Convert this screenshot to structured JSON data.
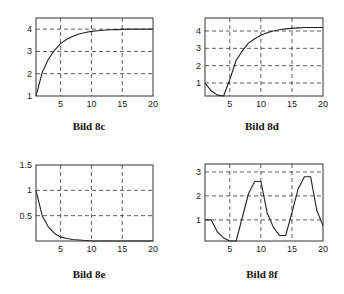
{
  "chart_data": [
    {
      "id": "8c",
      "type": "line",
      "title": "Bild 8c",
      "xlabel": "",
      "ylabel": "",
      "xlim": [
        1,
        20
      ],
      "ylim": [
        1,
        4.5
      ],
      "xticks": [
        5,
        10,
        15,
        20
      ],
      "yticks": [
        1,
        2,
        3,
        4
      ],
      "grid": true,
      "x": [
        1,
        2,
        3,
        4,
        5,
        6,
        7,
        8,
        9,
        10,
        11,
        12,
        13,
        14,
        15,
        16,
        17,
        18,
        19,
        20
      ],
      "values": [
        1.0,
        2.05,
        2.65,
        3.05,
        3.35,
        3.55,
        3.68,
        3.78,
        3.85,
        3.9,
        3.93,
        3.95,
        3.97,
        3.98,
        3.99,
        4.0,
        4.0,
        4.0,
        4.0,
        4.0
      ]
    },
    {
      "id": "8d",
      "type": "line",
      "title": "Bild 8d",
      "xlabel": "",
      "ylabel": "",
      "xlim": [
        1,
        20
      ],
      "ylim": [
        0.25,
        4.75
      ],
      "xticks": [
        5,
        10,
        15,
        20
      ],
      "yticks": [
        1,
        2,
        3,
        4
      ],
      "grid": true,
      "x": [
        1,
        2,
        3,
        4,
        5,
        6,
        7,
        8,
        9,
        10,
        11,
        12,
        13,
        14,
        15,
        16,
        17,
        18,
        19,
        20
      ],
      "values": [
        1.0,
        0.55,
        0.3,
        0.25,
        1.2,
        2.3,
        2.85,
        3.3,
        3.55,
        3.75,
        3.9,
        4.0,
        4.07,
        4.12,
        4.15,
        4.18,
        4.2,
        4.2,
        4.2,
        4.2
      ]
    },
    {
      "id": "8e",
      "type": "line",
      "title": "Bild 8e",
      "xlabel": "",
      "ylabel": "",
      "xlim": [
        1,
        20
      ],
      "ylim": [
        0,
        1.5
      ],
      "xticks": [
        5,
        10,
        15,
        20
      ],
      "yticks": [
        0.5,
        1,
        1.5
      ],
      "grid": true,
      "x": [
        1,
        2,
        3,
        4,
        5,
        6,
        7,
        8,
        9,
        10,
        11,
        12,
        13,
        14,
        15,
        16,
        17,
        18,
        19,
        20
      ],
      "values": [
        1.0,
        0.5,
        0.28,
        0.15,
        0.08,
        0.05,
        0.03,
        0.02,
        0.01,
        0.0,
        0.0,
        0.0,
        0.0,
        0.0,
        0.0,
        0.0,
        0.0,
        0.0,
        0.0,
        0.0
      ]
    },
    {
      "id": "8f",
      "type": "line",
      "title": "Bild 8f",
      "xlabel": "",
      "ylabel": "",
      "xlim": [
        1,
        20
      ],
      "ylim": [
        0.12,
        3.33
      ],
      "xticks": [
        5,
        10,
        15,
        20
      ],
      "yticks": [
        1,
        2,
        3
      ],
      "grid": true,
      "x": [
        1,
        2,
        3,
        4,
        5,
        6,
        7,
        8,
        9,
        10,
        11,
        12,
        13,
        14,
        15,
        16,
        17,
        18,
        19,
        20
      ],
      "values": [
        1.0,
        1.0,
        0.5,
        0.25,
        0.12,
        0.12,
        1.1,
        2.1,
        2.6,
        2.6,
        1.3,
        0.7,
        0.35,
        0.35,
        1.3,
        2.3,
        2.8,
        2.8,
        1.4,
        0.75
      ]
    }
  ],
  "captions": {
    "c": "Bild 8c",
    "d": "Bild 8d",
    "e": "Bild 8e",
    "f": "Bild 8f"
  }
}
